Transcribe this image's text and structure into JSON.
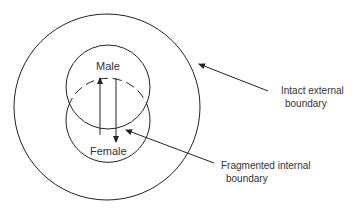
{
  "diagram": {
    "type": "nested-circles",
    "labels": {
      "male": "Male",
      "female": "Female",
      "external_line1": "Intact external",
      "external_line2": "boundary",
      "internal_line1": "Fragmented internal",
      "internal_line2": "boundary"
    },
    "elements": [
      {
        "id": "outer-circle",
        "kind": "circle",
        "style": "solid",
        "label": "Intact external boundary"
      },
      {
        "id": "male-circle",
        "kind": "circle",
        "style": "solid",
        "label": "Male"
      },
      {
        "id": "female-circle",
        "kind": "circle",
        "style": "solid-lower/dashed-upper",
        "label": "Female"
      },
      {
        "id": "arrow-up",
        "kind": "arrow",
        "from": "Female",
        "to": "Male"
      },
      {
        "id": "arrow-down",
        "kind": "arrow",
        "from": "Male",
        "to": "Female"
      }
    ],
    "colors": {
      "stroke": "#222222",
      "text": "#333333",
      "background": "#ffffff"
    }
  }
}
